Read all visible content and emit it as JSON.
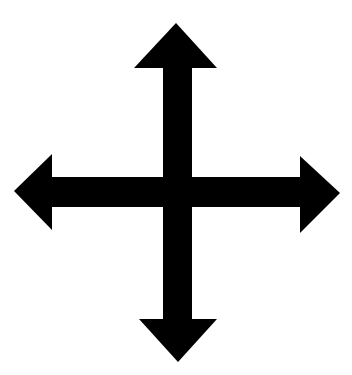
{
  "image": {
    "subject": "four-way arrow",
    "icon": "move-arrows-icon",
    "colors": {
      "background": "#ffffff",
      "fill": "#000000"
    },
    "arrows": [
      "up",
      "down",
      "left",
      "right"
    ]
  }
}
